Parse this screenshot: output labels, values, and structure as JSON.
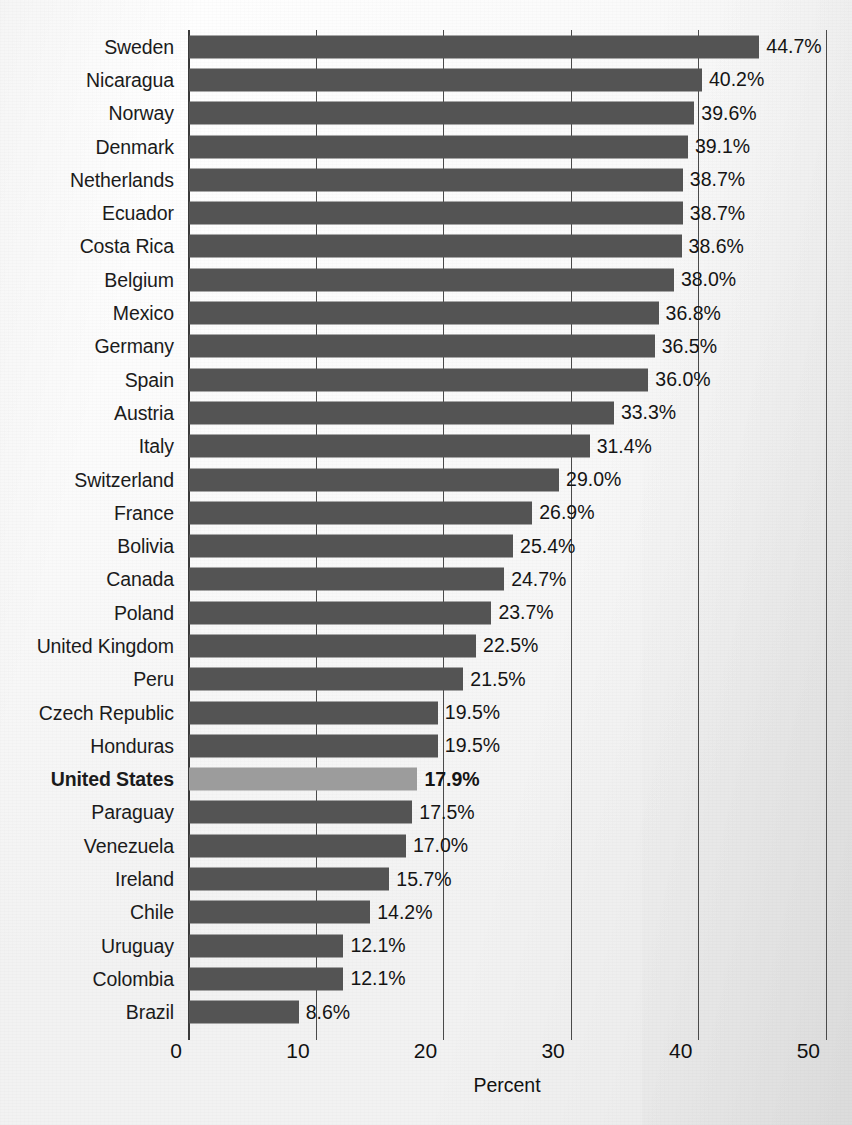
{
  "chart_data": {
    "type": "bar",
    "orientation": "horizontal",
    "title": "",
    "xlabel": "Percent",
    "ylabel": "",
    "xlim": [
      0,
      50
    ],
    "xticks": [
      0,
      10,
      20,
      30,
      40,
      50
    ],
    "xtick_labels": [
      "0",
      "10",
      "20",
      "30",
      "40",
      "50"
    ],
    "grid": "vertical",
    "legend": "none",
    "value_suffix": "%",
    "highlight_category": "United States",
    "colors": {
      "bar": "#545454",
      "bar_highlight": "#9c9c9c",
      "gridline": "#4a4a4a",
      "text": "#141414",
      "background": "#f7f7f7"
    },
    "categories": [
      "Sweden",
      "Nicaragua",
      "Norway",
      "Denmark",
      "Netherlands",
      "Ecuador",
      "Costa Rica",
      "Belgium",
      "Mexico",
      "Germany",
      "Spain",
      "Austria",
      "Italy",
      "Switzerland",
      "France",
      "Bolivia",
      "Canada",
      "Poland",
      "United Kingdom",
      "Peru",
      "Czech Republic",
      "Honduras",
      "United States",
      "Paraguay",
      "Venezuela",
      "Ireland",
      "Chile",
      "Uruguay",
      "Colombia",
      "Brazil"
    ],
    "values": [
      44.7,
      40.2,
      39.6,
      39.1,
      38.7,
      38.7,
      38.6,
      38.0,
      36.8,
      36.5,
      36.0,
      33.3,
      31.4,
      29.0,
      26.9,
      25.4,
      24.7,
      23.7,
      22.5,
      21.5,
      19.5,
      19.5,
      17.9,
      17.5,
      17.0,
      15.7,
      14.2,
      12.1,
      12.1,
      8.6
    ],
    "value_labels": [
      "44.7%",
      "40.2%",
      "39.6%",
      "39.1%",
      "38.7%",
      "38.7%",
      "38.6%",
      "38.0%",
      "36.8%",
      "36.5%",
      "36.0%",
      "33.3%",
      "31.4%",
      "29.0%",
      "26.9%",
      "25.4%",
      "24.7%",
      "23.7%",
      "22.5%",
      "21.5%",
      "19.5%",
      "19.5%",
      "17.9%",
      "17.5%",
      "17.0%",
      "15.7%",
      "14.2%",
      "12.1%",
      "12.1%",
      "8.6%"
    ]
  }
}
